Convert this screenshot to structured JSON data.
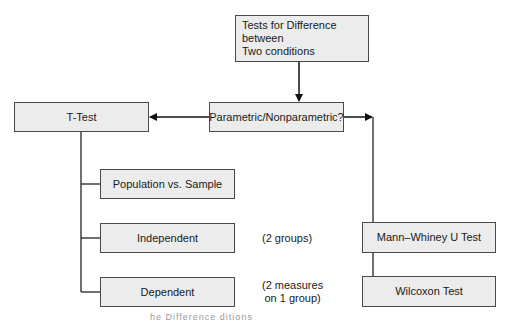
{
  "diagram": {
    "title_box": {
      "line1": "Tests for Difference between",
      "line2": "Two conditions"
    },
    "decision_box": {
      "label": "Parametric/Nonparametric?"
    },
    "parametric_branch": {
      "root": {
        "label": "T-Test"
      },
      "children": [
        {
          "label": "Population vs. Sample",
          "note": ""
        },
        {
          "label": "Independent",
          "note": "(2 groups)"
        },
        {
          "label": "Dependent",
          "note_line1": "(2 measures",
          "note_line2": "on 1 group)"
        }
      ]
    },
    "nonparametric_branch": {
      "children": [
        {
          "label": "Mann–Whiney U Test"
        },
        {
          "label": "Wilcoxon Test"
        }
      ]
    },
    "caption_fragment": "he Difference          ditions"
  },
  "colors": {
    "box_fill": "#ececec",
    "box_border": "#4a4a4a",
    "line": "#111111"
  }
}
